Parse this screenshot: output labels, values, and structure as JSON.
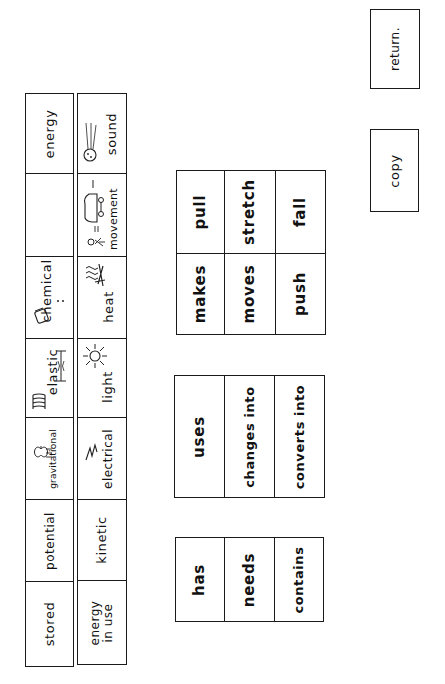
{
  "energy_table": {
    "row_forms": [
      {
        "label": "stored"
      },
      {
        "label": "potential"
      },
      {
        "label": "gravitational",
        "icon": "apple-falling-icon"
      },
      {
        "label": "elastic",
        "icon": "spring-icon"
      },
      {
        "label": "chemical",
        "icon": "battery-icon"
      },
      {
        "label": ""
      },
      {
        "label": "energy"
      }
    ],
    "row_in_use": [
      {
        "label": "energy in use",
        "line1": "energy",
        "line2": "in use"
      },
      {
        "label": "kinetic"
      },
      {
        "label": "electrical",
        "icon": "lightning-icon"
      },
      {
        "label": "light",
        "icon": "sun-icon"
      },
      {
        "label": "heat",
        "icon": "heat-waves-icon"
      },
      {
        "label": "movement",
        "icon": "car-person-icon"
      },
      {
        "label": "sound",
        "icon": "ball-sound-icon"
      }
    ]
  },
  "word_blocks": [
    {
      "name": "verbs-block",
      "cells": [
        [
          "makes",
          "pull"
        ],
        [
          "moves",
          "stretch"
        ],
        [
          "push",
          "fall"
        ]
      ]
    },
    {
      "name": "uses-block",
      "cells": [
        "uses",
        "changes into",
        "converts into"
      ]
    },
    {
      "name": "has-block",
      "cells": [
        "has",
        "needs",
        "contains"
      ]
    }
  ],
  "buttons": {
    "copy": "copy",
    "return": "return."
  }
}
